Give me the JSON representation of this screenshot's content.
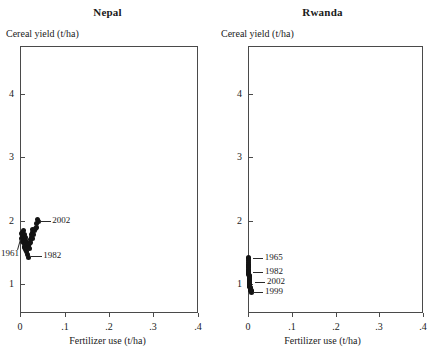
{
  "figure": {
    "panels": [
      {
        "key": "nepal",
        "title": "Nepal",
        "ylabel": "Cereal yield (t/ha)",
        "xlabel": "Fertilizer use (t/ha)"
      },
      {
        "key": "rwanda",
        "title": "Rwanda",
        "ylabel": "Cereal yield (t/ha)",
        "xlabel": "Fertilizer use (t/ha)"
      }
    ],
    "xticklabels": [
      "0",
      ".1",
      ".2",
      ".3",
      ".4"
    ],
    "yticklabels": [
      "1",
      "2",
      "3",
      "4"
    ]
  },
  "annotations": {
    "nepal": [
      {
        "label": "2002"
      },
      {
        "label": "1961"
      },
      {
        "label": "1982"
      }
    ],
    "rwanda": [
      {
        "label": "1965"
      },
      {
        "label": "1982"
      },
      {
        "label": "2002"
      },
      {
        "label": "1999"
      }
    ]
  },
  "chart_data": {
    "type": "scatter",
    "title": "",
    "layout": "two side-by-side panels",
    "xlabel": "Fertilizer use (t/ha)",
    "ylabel": "Cereal yield (t/ha)",
    "xlim": [
      0,
      0.4
    ],
    "ylim": [
      0.55,
      4.75
    ],
    "xticks": [
      0,
      0.1,
      0.2,
      0.3,
      0.4
    ],
    "xticklabels": [
      "0",
      ".1",
      ".2",
      ".3",
      ".4"
    ],
    "yticks": [
      1,
      2,
      3,
      4
    ],
    "yticklabels": [
      "1",
      "2",
      "3",
      "4"
    ],
    "grid": false,
    "legend": false,
    "marker_color": "#141414",
    "frame_color": "#4a4a4a",
    "panels": [
      {
        "name": "Nepal",
        "x": [
          0.0035,
          0.004,
          0.0045,
          0.005,
          0.0055,
          0.006,
          0.0065,
          0.007,
          0.0075,
          0.008,
          0.0085,
          0.009,
          0.0095,
          0.01,
          0.0105,
          0.011,
          0.0115,
          0.012,
          0.0125,
          0.013,
          0.014,
          0.015,
          0.016,
          0.017,
          0.018,
          0.019,
          0.02,
          0.021,
          0.022,
          0.023,
          0.024,
          0.025,
          0.026,
          0.027,
          0.028,
          0.029,
          0.03,
          0.032,
          0.034,
          0.036,
          0.038,
          0.04,
          0.042
        ],
        "y": [
          1.72,
          1.8,
          1.75,
          1.68,
          1.82,
          1.78,
          1.7,
          1.85,
          1.76,
          1.66,
          1.74,
          1.6,
          1.79,
          1.71,
          1.64,
          1.58,
          1.73,
          1.62,
          1.69,
          1.55,
          1.66,
          1.52,
          1.63,
          1.47,
          1.61,
          1.42,
          1.58,
          1.57,
          1.64,
          1.7,
          1.66,
          1.74,
          1.78,
          1.72,
          1.82,
          1.86,
          1.79,
          1.84,
          1.88,
          1.9,
          1.96,
          2.02,
          1.99
        ],
        "annotated_points": [
          {
            "label": "1961",
            "x": 0.0045,
            "y": 1.74
          },
          {
            "label": "1982",
            "x": 0.0185,
            "y": 1.44
          },
          {
            "label": "2002",
            "x": 0.039,
            "y": 1.99
          }
        ]
      },
      {
        "name": "Rwanda",
        "x": [
          0.0008,
          0.0009,
          0.001,
          0.0011,
          0.0012,
          0.0013,
          0.0014,
          0.0015,
          0.0016,
          0.0017,
          0.0018,
          0.0019,
          0.002,
          0.0021,
          0.0022,
          0.0023,
          0.0024,
          0.0025,
          0.0026,
          0.0027,
          0.0028,
          0.0029,
          0.003,
          0.0031,
          0.0032,
          0.0033,
          0.0034,
          0.0035,
          0.0036,
          0.0037,
          0.0038,
          0.004,
          0.0042,
          0.0044,
          0.0046,
          0.005,
          0.0055,
          0.006,
          0.0065,
          0.007,
          0.0075,
          0.008
        ],
        "y": [
          1.43,
          1.4,
          1.37,
          1.35,
          1.32,
          1.3,
          1.28,
          1.26,
          1.24,
          1.22,
          1.21,
          1.19,
          1.18,
          1.17,
          1.15,
          1.14,
          1.13,
          1.12,
          1.11,
          1.1,
          1.09,
          1.08,
          1.07,
          1.06,
          1.05,
          1.04,
          1.03,
          1.02,
          1.01,
          1.0,
          0.99,
          0.98,
          0.97,
          0.96,
          0.95,
          0.94,
          0.93,
          0.92,
          0.91,
          0.9,
          0.89,
          0.88
        ],
        "annotated_points": [
          {
            "label": "1965",
            "x": 0.0015,
            "y": 1.42
          },
          {
            "label": "1982",
            "x": 0.002,
            "y": 1.2
          },
          {
            "label": "2002",
            "x": 0.007,
            "y": 1.03
          },
          {
            "label": "1999",
            "x": 0.0025,
            "y": 0.88
          }
        ]
      }
    ]
  }
}
